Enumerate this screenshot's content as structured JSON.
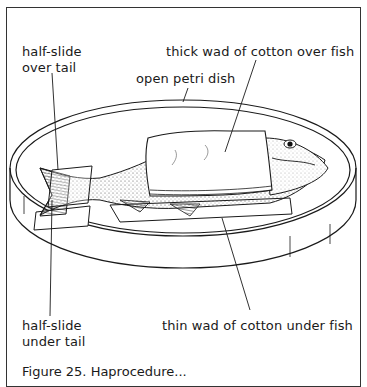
{
  "figure": {
    "labels": {
      "half_slide_over_tail": [
        "half-slide",
        "over tail"
      ],
      "thick_wad": "thick wad of cotton over fish",
      "open_petri_dish": "open petri dish",
      "half_slide_under_tail": [
        "half-slide",
        "under tail"
      ],
      "thin_wad": "thin wad of cotton under fish"
    },
    "caption": "Figure 25. Наprocedure..."
  }
}
